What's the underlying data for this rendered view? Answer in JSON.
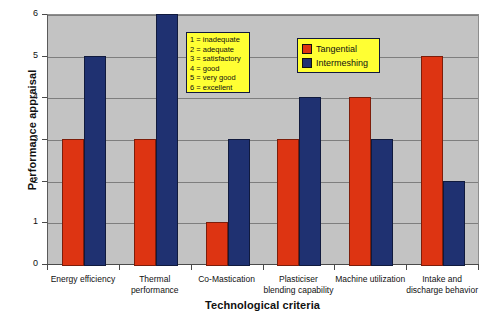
{
  "chart_data": {
    "type": "bar",
    "title": "",
    "xlabel": "Technological criteria",
    "ylabel": "Performance appraisal",
    "ylim": [
      0,
      6
    ],
    "yticks": [
      0,
      1,
      2,
      3,
      4,
      5,
      6
    ],
    "grid": true,
    "legend_position": "upper-right-inside",
    "categories": [
      "Energy efficiency",
      "Thermal performance",
      "Co-Mastication",
      "Plasticiser blending capability",
      "Machine utilization",
      "Intake and discharge behavior"
    ],
    "category_lines": [
      [
        "Energy efficiency"
      ],
      [
        "Thermal",
        "performance"
      ],
      [
        "Co-Mastication"
      ],
      [
        "Plasticiser",
        "blending capability"
      ],
      [
        "Machine utilization"
      ],
      [
        "Intake and",
        "discharge behavior"
      ]
    ],
    "series": [
      {
        "name": "Tangential",
        "color": "#dd3412",
        "values": [
          3,
          3,
          1,
          3,
          4,
          5
        ]
      },
      {
        "name": "Intermeshing",
        "color": "#1f3171",
        "values": [
          5,
          6,
          3,
          4,
          3,
          2
        ]
      }
    ],
    "annotations": {
      "scale_legend_title": "",
      "scale_legend_items": [
        "1 = inadequate",
        "2 = adequate",
        "3 = satisfactory",
        "4 = good",
        "5 = very good",
        "6 = excellent"
      ]
    },
    "colors": {
      "plot_background": "#c3c3c3",
      "page_background": "#ffffff",
      "gridline": "#7e7e7e",
      "axis": "#4a4a4a",
      "legend_background": "#ffff33",
      "legend_border": "#11183d"
    }
  }
}
